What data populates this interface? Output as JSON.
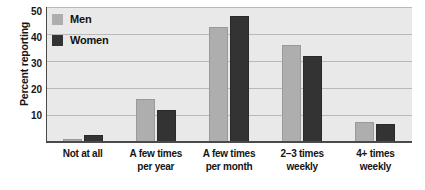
{
  "chart_data": {
    "type": "bar",
    "title": "",
    "subtitle": "",
    "xlabel": "",
    "ylabel": "Percent reporting",
    "ylim": [
      0,
      50
    ],
    "yticks": [
      10,
      20,
      30,
      40,
      50
    ],
    "grid": true,
    "legend_position": "top-left",
    "categories": [
      "Not at all",
      "A few times per year",
      "A few times per month",
      "2–3 times weekly",
      "4+ times weekly"
    ],
    "category_lines": [
      [
        "Not at all",
        ""
      ],
      [
        "A few times",
        "per year"
      ],
      [
        "A few times",
        "per month"
      ],
      [
        "2–3 times",
        "weekly"
      ],
      [
        "4+ times",
        "weekly"
      ]
    ],
    "series": [
      {
        "name": "Men",
        "color": "#aeaeae",
        "values": [
          1,
          16,
          42.5,
          36,
          7.5
        ]
      },
      {
        "name": "Women",
        "color": "#333333",
        "values": [
          2.5,
          12,
          46.5,
          32,
          6.5
        ]
      }
    ]
  },
  "legend": {
    "items": [
      {
        "label": "Men",
        "color": "#aeaeae"
      },
      {
        "label": "Women",
        "color": "#333333"
      }
    ]
  },
  "colors": {
    "plot_background": "#e9e9e9",
    "gridline": "#b9b9b9",
    "axis": "#4a4a4a",
    "men": "#aeaeae",
    "women": "#333333"
  }
}
